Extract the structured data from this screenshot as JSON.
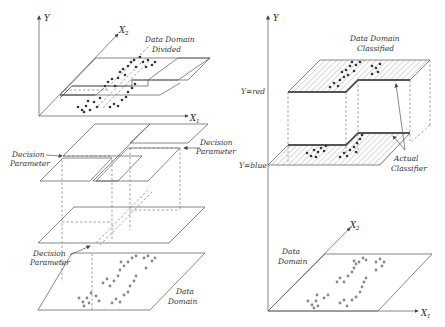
{
  "left_panel": {
    "axes": {
      "y": "Y",
      "x1": "X",
      "x1_sub": "1",
      "x2": "X",
      "x2_sub": "2"
    },
    "top_label_line1": "Data Domain",
    "top_label_line2": "Divided",
    "decision_left_line1": "Decision",
    "decision_left_line2": "Parameter",
    "decision_right_line1": "Decision",
    "decision_right_line2": "Parameter",
    "decision_bottom_line1": "Decision",
    "decision_bottom_line2": "Parameter",
    "bottom_label_line1": "Data",
    "bottom_label_line2": "Domain"
  },
  "right_panel": {
    "axes": {
      "y": "Y",
      "x1": "X",
      "x1_sub": "1",
      "x2": "X",
      "x2_sub": "2"
    },
    "top_label_line1": "Data Domain",
    "top_label_line2": "Classified",
    "y_red": "Y=red",
    "y_blue": "Y=blue",
    "classifier_line1": "Actual",
    "classifier_line2": "Classifier",
    "bottom_label_line1": "Data",
    "bottom_label_line2": "Domain"
  },
  "colors": {
    "dot_dark": "#333333",
    "dot_grey": "#888888",
    "line": "#555555"
  }
}
